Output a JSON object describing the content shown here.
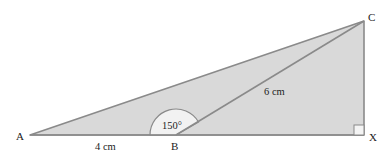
{
  "diagram": {
    "type": "geometry-triangle",
    "colors": {
      "fill": "#d9d9d9",
      "stroke": "#8a8a8a",
      "arc_fill": "#f2f2f2",
      "right_angle_fill": "#f4f4f4",
      "text": "#222222"
    },
    "points": {
      "A": {
        "label": "A",
        "x": 30,
        "y": 135
      },
      "B": {
        "label": "B",
        "x": 176,
        "y": 135
      },
      "C": {
        "label": "C",
        "x": 364,
        "y": 21
      },
      "X": {
        "label": "X",
        "x": 364,
        "y": 135
      }
    },
    "measurements": {
      "AB": "4 cm",
      "BC": "6 cm",
      "angle_ABC": "150°"
    },
    "right_angle_at": "X"
  }
}
